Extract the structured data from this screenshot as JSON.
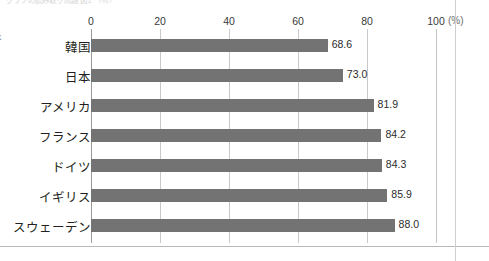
{
  "top_caption": "グラフの読み取り問題  図1            （％）",
  "chart_data": {
    "type": "bar",
    "orientation": "horizontal",
    "title": "",
    "xlabel": "",
    "ylabel": "",
    "unit_label": "(%)",
    "xlim": [
      0,
      100
    ],
    "xticks": [
      0,
      20,
      40,
      60,
      80,
      100
    ],
    "xtick_labels": [
      "0",
      "20",
      "40",
      "60",
      "80",
      "100"
    ],
    "grid": true,
    "grid_axis": "x",
    "legend": "none",
    "bar_color": "#737373",
    "categories": [
      "韓国",
      "日本",
      "アメリカ",
      "フランス",
      "ドイツ",
      "イギリス",
      "スウェーデン"
    ],
    "category_furigana": [
      "かんこく",
      "",
      "",
      "",
      "",
      "",
      ""
    ],
    "values": [
      68.6,
      73.0,
      81.9,
      84.2,
      84.3,
      85.9,
      88.0
    ],
    "value_labels": [
      "68.6",
      "73.0",
      "81.9",
      "84.2",
      "84.3",
      "85.9",
      "88.0"
    ]
  }
}
